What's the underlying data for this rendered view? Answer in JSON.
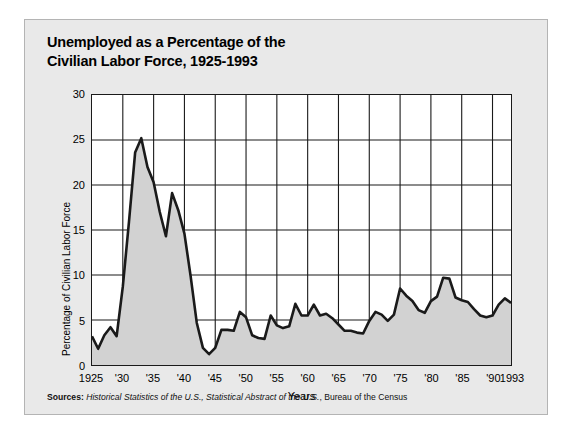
{
  "title": {
    "line1": "Unemployed as a Percentage of the",
    "line2": "Civilian Labor Force, 1925-1993"
  },
  "sources": {
    "label": "Sources:",
    "italic_part": "Historical Statistics of the U.S., Statistical Abstract of the U.S.",
    "rest": ", Bureau of the Census"
  },
  "colors": {
    "card_background": "#e9e9e9",
    "plot_background": "#ffffff",
    "area_fill": "#d2d2d2",
    "line": "#1a1a1a",
    "grid": "#1a1a1a",
    "text": "#000000"
  },
  "chart_data": {
    "type": "area",
    "title": "Unemployed as a Percentage of the Civilian Labor Force, 1925-1993",
    "xlabel": "Years",
    "ylabel": "Percentage of Civilian Labor Force",
    "xlim": [
      1925,
      1993
    ],
    "ylim": [
      0,
      30
    ],
    "yticks": [
      0,
      5,
      10,
      15,
      20,
      25,
      30
    ],
    "ytick_labels": [
      "0",
      "5",
      "10",
      "15",
      "20",
      "25",
      "30"
    ],
    "xticks": [
      1925,
      1930,
      1935,
      1940,
      1945,
      1950,
      1955,
      1960,
      1965,
      1970,
      1975,
      1980,
      1985,
      1990,
      1993
    ],
    "xtick_labels": [
      "1925",
      "'30",
      "'35",
      "'40",
      "'45",
      "'50",
      "'55",
      "'60",
      "'65",
      "'70",
      "'75",
      "'80",
      "'85",
      "'90",
      "1993"
    ],
    "grid": true,
    "legend": false,
    "series_name": "Unemployment rate",
    "x": [
      1925,
      1926,
      1927,
      1928,
      1929,
      1930,
      1931,
      1932,
      1933,
      1934,
      1935,
      1936,
      1937,
      1938,
      1939,
      1940,
      1941,
      1942,
      1943,
      1944,
      1945,
      1946,
      1947,
      1948,
      1949,
      1950,
      1951,
      1952,
      1953,
      1954,
      1955,
      1956,
      1957,
      1958,
      1959,
      1960,
      1961,
      1962,
      1963,
      1964,
      1965,
      1966,
      1967,
      1968,
      1969,
      1970,
      1971,
      1972,
      1973,
      1974,
      1975,
      1976,
      1977,
      1978,
      1979,
      1980,
      1981,
      1982,
      1983,
      1984,
      1985,
      1986,
      1987,
      1988,
      1989,
      1990,
      1991,
      1992,
      1993
    ],
    "values": [
      3.2,
      1.8,
      3.3,
      4.2,
      3.2,
      8.7,
      15.9,
      23.6,
      25.2,
      22.0,
      20.3,
      17.0,
      14.3,
      19.1,
      17.2,
      14.6,
      9.9,
      4.7,
      1.9,
      1.2,
      1.9,
      3.9,
      3.9,
      3.8,
      5.9,
      5.3,
      3.3,
      3.0,
      2.9,
      5.5,
      4.4,
      4.1,
      4.3,
      6.8,
      5.5,
      5.5,
      6.7,
      5.5,
      5.7,
      5.2,
      4.5,
      3.8,
      3.8,
      3.6,
      3.5,
      4.9,
      5.9,
      5.6,
      4.9,
      5.6,
      8.5,
      7.7,
      7.1,
      6.1,
      5.8,
      7.1,
      7.6,
      9.7,
      9.6,
      7.5,
      7.2,
      7.0,
      6.2,
      5.5,
      5.3,
      5.5,
      6.7,
      7.4,
      6.9
    ]
  }
}
